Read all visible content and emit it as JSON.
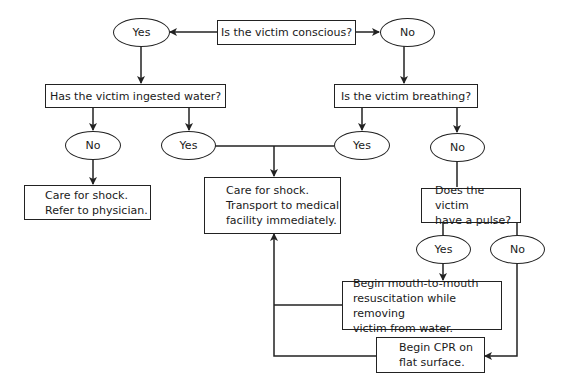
{
  "diagram": {
    "type": "flowchart",
    "nodes": {
      "q_conscious": "Is the victim conscious?",
      "conscious_yes": "Yes",
      "conscious_no": "No",
      "q_ingested": "Has the victim ingested water?",
      "q_breathing": "Is the victim breathing?",
      "ingested_no": "No",
      "ingested_yes": "Yes",
      "breathing_yes": "Yes",
      "breathing_no": "No",
      "action_refer": "Care for shock.\nRefer to physician.",
      "action_transport": "Care for shock.\nTransport to medical\nfacility immediately.",
      "q_pulse": "Does the victim\nhave a pulse?",
      "pulse_yes": "Yes",
      "pulse_no": "No",
      "action_mouth": "Begin mouth-to-mouth\nresuscitation while removing\nvictim from water.",
      "action_cpr": "Begin CPR on\nflat surface."
    },
    "edges": [
      {
        "from": "q_conscious",
        "to": "conscious_yes"
      },
      {
        "from": "q_conscious",
        "to": "conscious_no"
      },
      {
        "from": "conscious_yes",
        "to": "q_ingested"
      },
      {
        "from": "conscious_no",
        "to": "q_breathing"
      },
      {
        "from": "q_ingested",
        "to": "ingested_no"
      },
      {
        "from": "q_ingested",
        "to": "ingested_yes"
      },
      {
        "from": "q_breathing",
        "to": "breathing_yes"
      },
      {
        "from": "q_breathing",
        "to": "breathing_no"
      },
      {
        "from": "ingested_no",
        "to": "action_refer"
      },
      {
        "from": "ingested_yes",
        "to": "action_transport"
      },
      {
        "from": "breathing_yes",
        "to": "action_transport"
      },
      {
        "from": "breathing_no",
        "to": "q_pulse"
      },
      {
        "from": "q_pulse",
        "to": "pulse_yes"
      },
      {
        "from": "q_pulse",
        "to": "pulse_no"
      },
      {
        "from": "pulse_yes",
        "to": "action_mouth"
      },
      {
        "from": "pulse_no",
        "to": "action_cpr"
      },
      {
        "from": "action_mouth",
        "to": "action_transport"
      },
      {
        "from": "action_cpr",
        "to": "action_transport"
      }
    ],
    "colors": {
      "line": "#222222",
      "background": "#ffffff",
      "text": "#1a1a1a"
    }
  }
}
